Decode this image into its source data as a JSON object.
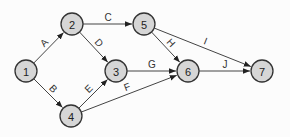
{
  "diagram": {
    "type": "activity-on-arrow network",
    "nodes": [
      {
        "id": "1",
        "label": "1",
        "x": 26,
        "y": 71
      },
      {
        "id": "2",
        "label": "2",
        "x": 72,
        "y": 24
      },
      {
        "id": "3",
        "label": "3",
        "x": 116,
        "y": 71
      },
      {
        "id": "4",
        "label": "4",
        "x": 71,
        "y": 116
      },
      {
        "id": "5",
        "label": "5",
        "x": 144,
        "y": 24
      },
      {
        "id": "6",
        "label": "6",
        "x": 188,
        "y": 71
      },
      {
        "id": "7",
        "label": "7",
        "x": 262,
        "y": 71
      }
    ],
    "edges": [
      {
        "from": "1",
        "to": "2",
        "label": "A"
      },
      {
        "from": "1",
        "to": "4",
        "label": "B"
      },
      {
        "from": "2",
        "to": "5",
        "label": "C"
      },
      {
        "from": "2",
        "to": "3",
        "label": "D"
      },
      {
        "from": "4",
        "to": "3",
        "label": "E"
      },
      {
        "from": "4",
        "to": "6",
        "label": "F"
      },
      {
        "from": "3",
        "to": "6",
        "label": "G"
      },
      {
        "from": "5",
        "to": "6",
        "label": "H"
      },
      {
        "from": "5",
        "to": "7",
        "label": "I"
      },
      {
        "from": "6",
        "to": "7",
        "label": "J"
      }
    ],
    "style": {
      "node_fill": "#d6d6d6",
      "node_stroke": "#333333",
      "edge_color": "#444444",
      "node_radius": 11
    }
  }
}
